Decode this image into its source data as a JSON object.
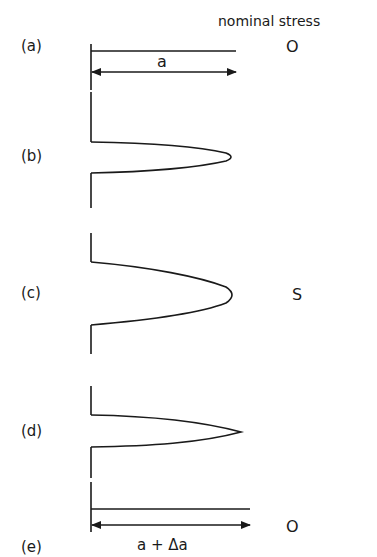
{
  "header": {
    "column_title": "nominal stress"
  },
  "panels": [
    {
      "id": "a",
      "label": "(a)",
      "stress": "O",
      "dimension": "a"
    },
    {
      "id": "b",
      "label": "(b)",
      "stress": ""
    },
    {
      "id": "c",
      "label": "(c)",
      "stress": "S"
    },
    {
      "id": "d",
      "label": "(d)",
      "stress": ""
    },
    {
      "id": "e",
      "label": "(e)",
      "stress": "O",
      "dimension": "a + Δa"
    }
  ],
  "colors": {
    "line": "#1a1a1a",
    "background": "#ffffff"
  }
}
